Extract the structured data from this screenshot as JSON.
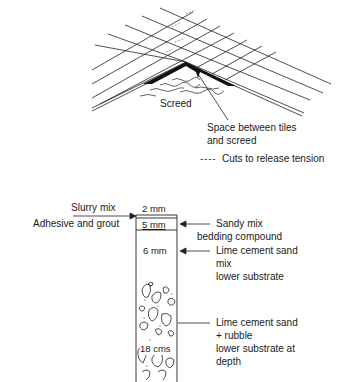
{
  "top_diagram": {
    "labels": {
      "screed": "Screed",
      "space_line1": "Space between tiles",
      "space_line2": "and screed",
      "legend_dashes": "- - - -",
      "legend_text": "Cuts to release tension"
    }
  },
  "bottom_diagram": {
    "left_labels": {
      "slurry": "Slurry mix",
      "adhesive": "Adhesive and grout"
    },
    "layer_thicknesses": {
      "slurry": "2 mm",
      "sandy": "5 mm",
      "lime": "6 mm",
      "rubble": "18 cms"
    },
    "right_labels": {
      "sandy_line1": "Sandy mix",
      "sandy_line2": "bedding compound",
      "lime_line1": "Lime cement sand",
      "lime_line2": "mix",
      "lime_line3": "lower substrate",
      "rubble_line1": "Lime cement sand",
      "rubble_line2": "+ rubble",
      "rubble_line3": "lower substrate at",
      "rubble_line4": "depth"
    }
  }
}
